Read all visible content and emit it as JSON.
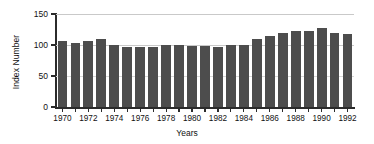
{
  "chart_data": {
    "type": "bar",
    "title": "",
    "xlabel": "Years",
    "ylabel": "Index Number",
    "categories": [
      1970,
      1971,
      1972,
      1973,
      1974,
      1975,
      1976,
      1977,
      1978,
      1979,
      1980,
      1981,
      1982,
      1983,
      1984,
      1985,
      1986,
      1987,
      1988,
      1989,
      1990,
      1991,
      1992
    ],
    "values": [
      107,
      103,
      106,
      109,
      100,
      96,
      97,
      97,
      100,
      100,
      98,
      98,
      96,
      100,
      100,
      110,
      114,
      119,
      123,
      123,
      128,
      120,
      117
    ],
    "ylim": [
      0,
      150
    ],
    "yticks": [
      0,
      50,
      100,
      150
    ],
    "ytick_labels": [
      "0",
      "50",
      "100",
      "150"
    ],
    "xtick_labels": [
      "1970",
      "1972",
      "1974",
      "1976",
      "1978",
      "1980",
      "1982",
      "1984",
      "1986",
      "1988",
      "1990",
      "1992"
    ],
    "xticks": [
      1970,
      1972,
      1974,
      1976,
      1978,
      1980,
      1982,
      1984,
      1986,
      1988,
      1990,
      1992
    ],
    "grid": "horizontal",
    "legend": "none",
    "bar_color": "#4d4d4d",
    "axis_color": "#2b2b2b",
    "grid_color": "#c9c9c9"
  }
}
